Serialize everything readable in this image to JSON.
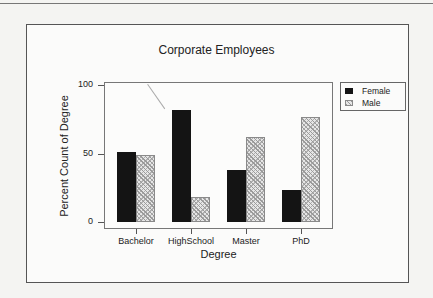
{
  "chart_data": {
    "type": "bar",
    "title": "Corporate Employees",
    "xlabel": "Degree",
    "ylabel": "Percent Count of Degree",
    "categories": [
      "Bachelor",
      "HighSchool",
      "Master",
      "PhD"
    ],
    "series": [
      {
        "name": "Female",
        "values": [
          51,
          82,
          38,
          23
        ],
        "color": "#141414",
        "pattern": "solid"
      },
      {
        "name": "Male",
        "values": [
          49,
          18,
          62,
          77
        ],
        "color": "#d0d0d0",
        "pattern": "crosshatch"
      }
    ],
    "ylim": [
      0,
      100
    ],
    "yticks": [
      "0",
      "50",
      "100"
    ],
    "grid": false,
    "legend_position": "right-top"
  },
  "legend": {
    "items": [
      {
        "label": "Female"
      },
      {
        "label": "Male"
      }
    ]
  }
}
